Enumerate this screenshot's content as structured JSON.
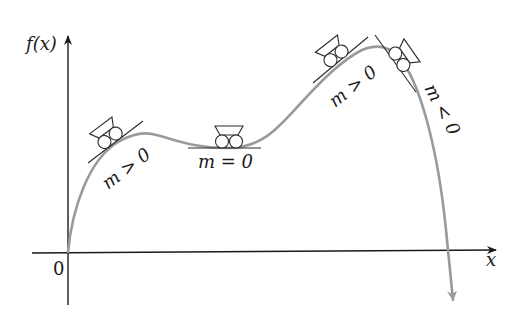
{
  "diagram": {
    "y_axis_label": "f(x)",
    "x_axis_label": "x",
    "origin_label": "0",
    "colors": {
      "axis": "#1a1a1a",
      "curve": "#9a9a9a",
      "cart": "#2a2a2a",
      "background": "#ffffff"
    },
    "carts": [
      {
        "id": "cart-1",
        "position": "rising segment near first local maximum",
        "slope_label": "m > 0",
        "icon": "cart-icon"
      },
      {
        "id": "cart-2",
        "position": "local minimum (flat)",
        "slope_label": "m = 0",
        "icon": "cart-icon"
      },
      {
        "id": "cart-3",
        "position": "rising segment near global maximum",
        "slope_label": "m > 0",
        "icon": "cart-icon"
      },
      {
        "id": "cart-4",
        "position": "falling segment after global maximum",
        "slope_label": "m < 0",
        "icon": "cart-icon"
      }
    ]
  }
}
